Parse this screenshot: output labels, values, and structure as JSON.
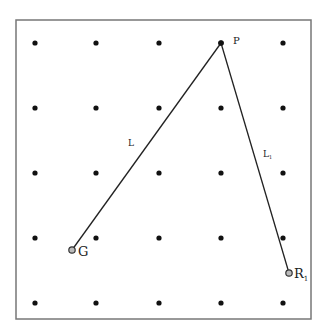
{
  "diagram": {
    "frame": {
      "x": 16,
      "y": 20,
      "width": 295,
      "height": 299,
      "stroke": "#777777"
    },
    "grid": {
      "xs": [
        35,
        96,
        159,
        221,
        283
      ],
      "ys": [
        43,
        108,
        173,
        238,
        303
      ],
      "dot_color": "#111111"
    },
    "points": {
      "P": {
        "label": "P",
        "x": 221,
        "y": 43
      },
      "G": {
        "label": "G",
        "x": 72,
        "y": 250
      },
      "R1": {
        "label": "R",
        "subscript": "1",
        "x": 289,
        "y": 273
      }
    },
    "segments": [
      {
        "name": "L",
        "label": "L",
        "from": "G",
        "to": "P"
      },
      {
        "name": "L1",
        "label": "L",
        "subscript": "1",
        "from": "P",
        "to": "R1"
      }
    ]
  }
}
